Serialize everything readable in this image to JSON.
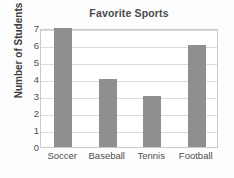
{
  "chart_data": {
    "type": "bar",
    "title": "Favorite Sports",
    "xlabel": "",
    "ylabel": "Number of Students",
    "categories": [
      "Soccer",
      "Baseball",
      "Tennis",
      "Football"
    ],
    "values": [
      7,
      4,
      3,
      6
    ],
    "ylim": [
      0,
      7
    ],
    "ytick_labels": [
      "7",
      "6",
      "5",
      "4",
      "3",
      "2",
      "1",
      "0"
    ],
    "ytick_values": [
      7,
      6,
      5,
      4,
      3,
      2,
      1,
      0
    ],
    "grid": true,
    "grid_axis": "y",
    "legend": false,
    "legend_position": "none",
    "bar_color": "#8f8f8f",
    "grid_color": "#dcdcdc",
    "frame_color": "#c9c9c9",
    "title_color": "#4a4a4a",
    "tick_color": "#4d4d4d",
    "background_color": "#fdfdfd"
  }
}
